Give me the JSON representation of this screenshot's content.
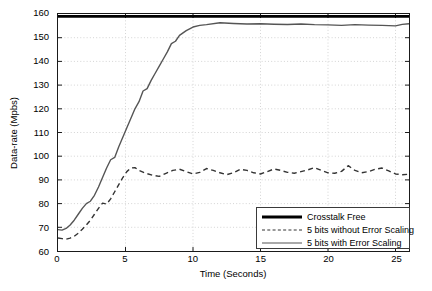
{
  "chart_data": {
    "type": "line",
    "title": "",
    "xlabel": "Time (Seconds)",
    "ylabel": "Data-rate (Mpbs)",
    "xlim": [
      0,
      26
    ],
    "ylim": [
      60,
      160
    ],
    "xticks": [
      0,
      5,
      10,
      15,
      20,
      25
    ],
    "yticks": [
      60,
      70,
      80,
      90,
      100,
      110,
      120,
      130,
      140,
      150,
      160
    ],
    "grid": true,
    "grid_style": "dotted",
    "legend_position": "lower right",
    "series": [
      {
        "name": "Crosstalk Free",
        "style": "solid",
        "width": 3,
        "color": "#000000",
        "x": [
          0,
          2,
          4,
          6,
          8,
          10,
          12,
          14,
          16,
          18,
          20,
          22,
          24,
          26
        ],
        "values": [
          159,
          159,
          159,
          159,
          159,
          159,
          159,
          159,
          159,
          159,
          159,
          159,
          159,
          159
        ]
      },
      {
        "name": "5 bits without Error Scaling",
        "style": "dashed",
        "width": 1.4,
        "color": "#333333",
        "x": [
          0,
          0.3,
          0.6,
          0.9,
          1.2,
          1.5,
          1.8,
          2.1,
          2.4,
          2.7,
          3.0,
          3.3,
          3.6,
          3.9,
          4.2,
          4.5,
          4.8,
          5.1,
          5.4,
          5.7,
          6.0,
          6.5,
          7.0,
          7.5,
          8.0,
          8.5,
          9.0,
          9.5,
          10.0,
          10.5,
          11.0,
          11.5,
          12.0,
          12.5,
          13.0,
          13.5,
          14.0,
          14.5,
          15.0,
          15.5,
          16.0,
          16.5,
          17.0,
          17.5,
          18.0,
          18.5,
          19.0,
          19.5,
          20.0,
          20.5,
          21.0,
          21.5,
          22.0,
          22.5,
          23.0,
          23.5,
          24.0,
          24.5,
          25.0,
          25.5,
          26.0
        ],
        "values": [
          65.5,
          65.2,
          65.0,
          65.4,
          66.2,
          67.5,
          69.2,
          71.0,
          73.0,
          75.5,
          78.0,
          80.2,
          79.8,
          82.0,
          85.0,
          88.0,
          91.0,
          93.5,
          95.0,
          95.2,
          94.0,
          92.8,
          92.0,
          91.5,
          92.8,
          94.0,
          94.5,
          93.5,
          92.5,
          93.2,
          94.8,
          94.0,
          93.0,
          92.2,
          93.0,
          94.5,
          94.0,
          93.0,
          92.5,
          93.5,
          94.6,
          94.0,
          93.2,
          92.8,
          93.5,
          94.2,
          95.2,
          94.0,
          93.0,
          92.8,
          93.6,
          96.0,
          94.0,
          93.0,
          93.5,
          94.5,
          95.0,
          93.8,
          92.5,
          92.2,
          92.4
        ]
      },
      {
        "name": "5 bits with Error Scaling",
        "style": "solid",
        "width": 1.4,
        "color": "#555555",
        "x": [
          0,
          0.3,
          0.6,
          0.9,
          1.2,
          1.5,
          1.8,
          2.1,
          2.4,
          2.7,
          3.0,
          3.3,
          3.6,
          3.9,
          4.2,
          4.5,
          4.8,
          5.1,
          5.4,
          5.7,
          6.0,
          6.3,
          6.6,
          6.9,
          7.2,
          7.5,
          7.8,
          8.1,
          8.4,
          8.7,
          9.0,
          9.5,
          10.0,
          10.5,
          11.0,
          12.0,
          13.0,
          14.0,
          15.0,
          16.0,
          17.0,
          18.0,
          19.0,
          20.0,
          21.0,
          22.0,
          23.0,
          24.0,
          25.0,
          25.5,
          26.0
        ],
        "values": [
          69.0,
          68.8,
          69.5,
          71.0,
          73.0,
          75.5,
          78.0,
          80.0,
          81.0,
          83.5,
          87.0,
          91.0,
          95.0,
          98.5,
          99.5,
          104.0,
          108.0,
          112.0,
          116.0,
          120.0,
          123.0,
          127.5,
          128.5,
          132.0,
          135.0,
          138.0,
          141.0,
          144.0,
          147.5,
          148.5,
          151.0,
          153.0,
          154.5,
          155.2,
          155.5,
          156.3,
          156.0,
          155.8,
          155.9,
          155.7,
          155.6,
          155.8,
          155.5,
          155.4,
          155.2,
          155.5,
          155.3,
          155.2,
          155.0,
          155.6,
          155.9
        ]
      }
    ]
  },
  "axes": {
    "y_title": "Data-rate (Mpbs)",
    "x_title": "Time (Seconds)",
    "ytick_labels": [
      "160",
      "150",
      "140",
      "130",
      "120",
      "110",
      "100",
      "90",
      "80",
      "70",
      "60"
    ],
    "xtick_labels": [
      "0",
      "5",
      "10",
      "15",
      "20",
      "25"
    ]
  },
  "legend": {
    "entries": [
      {
        "label": "Crosstalk Free",
        "style": "thick"
      },
      {
        "label": "5 bits without Error Scaling",
        "style": "dashed"
      },
      {
        "label": "5 bits with Error Scaling",
        "style": "thin"
      }
    ]
  }
}
